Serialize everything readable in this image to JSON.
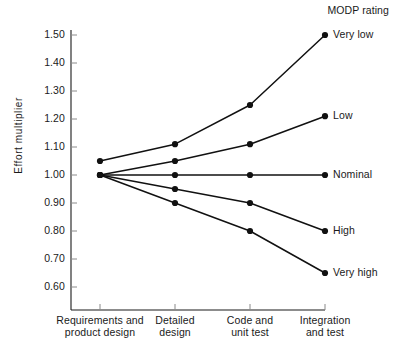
{
  "chart_data": {
    "type": "line",
    "title": "",
    "legend_title": "MODP rating",
    "legend_position": "right-of-plot, inline at series end",
    "xlabel": "",
    "ylabel": "Effort multiplier",
    "categories": [
      "Requirements and product design",
      "Detailed design",
      "Code and unit test",
      "Integration and test"
    ],
    "category_lines": [
      [
        "Requirements and",
        "product design"
      ],
      [
        "Detailed",
        "design"
      ],
      [
        "Code and",
        "unit test"
      ],
      [
        "Integration",
        "and test"
      ]
    ],
    "ylim": [
      0.55,
      1.54
    ],
    "yticks": [
      0.6,
      0.7,
      0.8,
      0.9,
      1.0,
      1.1,
      1.2,
      1.3,
      1.4,
      1.5
    ],
    "ytick_labels": [
      "0.60",
      "0.70",
      "0.80",
      "0.90",
      "1.00",
      "1.10",
      "1.20",
      "1.30",
      "1.40",
      "1.50"
    ],
    "grid": false,
    "marker": "filled-circle",
    "line_color": "#111111",
    "series": [
      {
        "name": "Very low",
        "label": "Very low",
        "values": [
          1.05,
          1.11,
          1.25,
          1.5
        ]
      },
      {
        "name": "Low",
        "label": "Low",
        "values": [
          1.0,
          1.05,
          1.11,
          1.21
        ]
      },
      {
        "name": "Nominal",
        "label": "Nominal",
        "values": [
          1.0,
          1.0,
          1.0,
          1.0
        ]
      },
      {
        "name": "High",
        "label": "High",
        "values": [
          1.0,
          0.95,
          0.9,
          0.8
        ]
      },
      {
        "name": "Very high",
        "label": "Very high",
        "values": [
          1.0,
          0.9,
          0.8,
          0.65
        ]
      }
    ]
  }
}
